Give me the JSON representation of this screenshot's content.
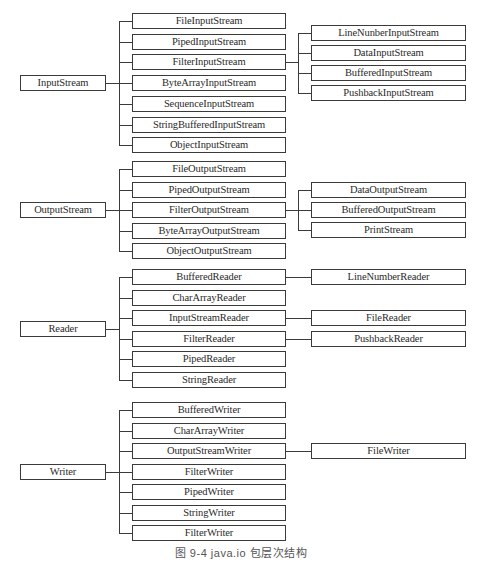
{
  "diagram": {
    "caption": "图 9-4   java.io 包层次结构",
    "layout": {
      "root_x": 20,
      "root_w": 86,
      "mid_x": 132,
      "mid_w": 154,
      "right_x": 311,
      "right_w": 155,
      "box_h": 16,
      "line_color": "#3a3a3a"
    },
    "groups": [
      {
        "root": "InputStream",
        "first_top": 13,
        "pitch": 20.7,
        "children": [
          {
            "label": "FileInputStream"
          },
          {
            "label": "PipedInputStream"
          },
          {
            "label": "FilterInputStream",
            "children": [
              "LineNunberInputStream",
              "DataInputStream",
              "BufferedInputStream",
              "PushbackInputStream"
            ]
          },
          {
            "label": "ByteArrayInputStream"
          },
          {
            "label": "SequenceInputStream"
          },
          {
            "label": "StringBufferedInputStream"
          },
          {
            "label": "ObjectInputStream"
          }
        ],
        "sub_first_top": 25,
        "sub_pitch": 20
      },
      {
        "root": "OutputStream",
        "first_top": 161,
        "pitch": 20.5,
        "children": [
          {
            "label": "FileOutputStream"
          },
          {
            "label": "PipedOutputStream"
          },
          {
            "label": "FilterOutputStream",
            "children": [
              "DataOutputStream",
              "BufferedOutputStream",
              "PrintStream"
            ]
          },
          {
            "label": "ByteArrayOutputStream"
          },
          {
            "label": "ObjectOutputStream"
          }
        ],
        "sub_first_top": 182,
        "sub_pitch": 20
      },
      {
        "root": "Reader",
        "first_top": 269,
        "pitch": 20.6,
        "children": [
          {
            "label": "BufferedReader",
            "children": [
              "LineNumberReader"
            ]
          },
          {
            "label": "CharArrayReader"
          },
          {
            "label": "InputStreamReader",
            "children": [
              "FileReader"
            ]
          },
          {
            "label": "FilterReader",
            "children": [
              "PushbackReader"
            ]
          },
          {
            "label": "PipedReader"
          },
          {
            "label": "StringReader"
          }
        ]
      },
      {
        "root": "Writer",
        "first_top": 402,
        "pitch": 20.5,
        "children": [
          {
            "label": "BufferedWriter"
          },
          {
            "label": "CharArrayWriter"
          },
          {
            "label": "OutputStreamWriter",
            "children": [
              "FileWriter"
            ]
          },
          {
            "label": "FilterWriter"
          },
          {
            "label": "PipedWriter"
          },
          {
            "label": "StringWriter"
          },
          {
            "label": "FilterWriter"
          }
        ]
      }
    ]
  }
}
